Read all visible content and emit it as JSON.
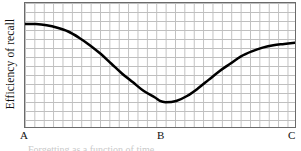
{
  "figure": {
    "y_axis_label": "Efficiency of recall",
    "x_point_labels": [
      "A",
      "B",
      "C"
    ],
    "caption_partial": "Forgetting as a function of time"
  },
  "colors": {
    "curve": "#000000",
    "grid": "#bfbfbf",
    "frame": "#6b6b6b",
    "text": "#111111",
    "background": "#ffffff"
  },
  "chart_data": {
    "type": "line",
    "title": "",
    "subtitle": "",
    "xlabel": "",
    "ylabel": "Efficiency of recall",
    "grid": true,
    "legend": false,
    "xlim": [
      0,
      100
    ],
    "ylim": [
      0,
      100
    ],
    "x_tick_labels": [
      "A",
      "B",
      "C"
    ],
    "x_tick_positions": [
      0,
      50,
      100
    ],
    "y_tick_labels": [],
    "annotations": [],
    "series": [
      {
        "name": "Efficiency of recall",
        "x": [
          0,
          4,
          8,
          12,
          16,
          20,
          24,
          28,
          32,
          36,
          40,
          44,
          48,
          50,
          52,
          56,
          60,
          64,
          68,
          72,
          76,
          80,
          84,
          88,
          92,
          96,
          100
        ],
        "y": [
          83,
          83,
          82,
          80,
          77,
          72,
          66,
          59,
          51,
          43,
          36,
          29,
          24,
          21,
          20,
          21,
          25,
          31,
          38,
          45,
          51,
          57,
          61,
          64,
          66,
          67,
          68
        ]
      }
    ],
    "shape_description": "U-shaped forgetting / retroactive interference curve: high efficiency of recall at A, falling to a minimum at B, then rising again toward C but not fully recovering to the initial level."
  }
}
